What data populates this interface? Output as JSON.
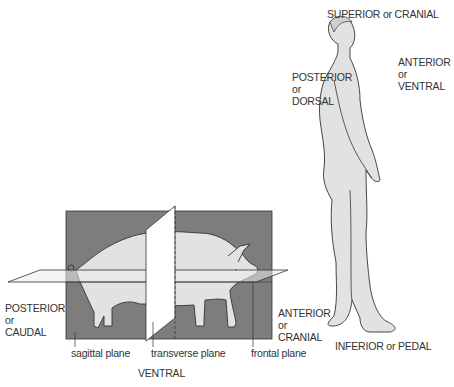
{
  "colors": {
    "plane_fill": "#7d7d7d",
    "body_fill": "#e2e2e2",
    "outline": "#333333",
    "text": "#333333"
  },
  "human": {
    "superior": "SUPERIOR or CRANIAL",
    "anterior": [
      "ANTERIOR",
      "or",
      "VENTRAL"
    ],
    "posterior": [
      "POSTERIOR",
      "or",
      "DORSAL"
    ],
    "inferior": "INFERIOR or PEDAL"
  },
  "pig": {
    "posterior": [
      "POSTERIOR",
      "or",
      "CAUDAL"
    ],
    "anterior": [
      "ANTERIOR",
      "or",
      "CRANIAL"
    ],
    "ventral": "VENTRAL",
    "planes": {
      "sagittal": "sagittal plane",
      "transverse": "transverse plane",
      "frontal": "frontal plane"
    }
  }
}
